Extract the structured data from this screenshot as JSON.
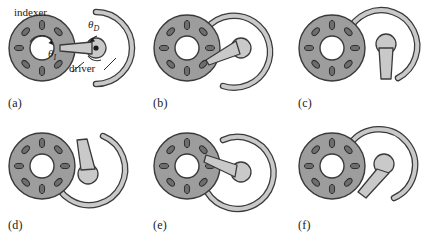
{
  "figure": {
    "type": "mechanism-diagram",
    "background_color": "#ffffff",
    "panel_count": 6,
    "grid": {
      "rows": 2,
      "cols": 3
    }
  },
  "colors": {
    "disc_fill": "#9d9d9d",
    "disc_stroke": "#3a3a3a",
    "hub_fill": "#ffffff",
    "slot_fill": "#6e6e6e",
    "slot_stroke": "#2f2f2f",
    "arm_fill": "#c9c9c9",
    "arm_stroke": "#3a3a3a",
    "arc_fill": "#c9c9c9",
    "arc_stroke": "#3a3a3a",
    "text": "#1a1a1a"
  },
  "annotations": {
    "indexer_label": "indexer",
    "driver_label": "driver",
    "theta_indexer": "θ",
    "theta_indexer_sub": "I",
    "theta_driver": "θ",
    "theta_driver_sub": "D"
  },
  "panels": [
    {
      "id": "a",
      "caption": "(a)",
      "arm_angle_deg": 0,
      "arm_description": "driver arm horizontal pointing left into indexer slot",
      "arc_gap_deg": 180,
      "engaged": true,
      "has_annotations": true
    },
    {
      "id": "b",
      "caption": "(b)",
      "arm_angle_deg": 205,
      "arm_description": "driver arm tilted down-left engaging slot",
      "arc_gap_deg": 165,
      "engaged": true,
      "has_annotations": false
    },
    {
      "id": "c",
      "caption": "(c)",
      "arm_angle_deg": 270,
      "arm_description": "driver arm pointing straight down, disengaged",
      "arc_gap_deg": 140,
      "engaged": false,
      "has_annotations": false
    },
    {
      "id": "d",
      "caption": "(d)",
      "arm_angle_deg": 90,
      "arm_description": "driver arm pointing up, arc sweeping across indexer",
      "arc_gap_deg": 60,
      "engaged": false,
      "has_annotations": false
    },
    {
      "id": "e",
      "caption": "(e)",
      "arm_angle_deg": 160,
      "arm_description": "driver arm tilted up-left engaging slot",
      "arc_gap_deg": 110,
      "engaged": true,
      "has_annotations": false
    },
    {
      "id": "f",
      "caption": "(f)",
      "arm_angle_deg": 120,
      "arm_description": "driver arm tilted up-left, disengaging",
      "arc_gap_deg": 45,
      "engaged": false,
      "has_annotations": false
    }
  ],
  "indexer": {
    "slot_count": 8,
    "outer_radius": 33,
    "hub_radius": 12,
    "slot_radius": 23,
    "description": "slotted disc with eight radial oval slots and central bore"
  },
  "driver": {
    "arc_outer_radius": 36,
    "arc_inner_radius": 31,
    "hub_radius": 10,
    "arm_length": 30,
    "description": "C-shaped locking arc with central hub and tapered crank arm"
  }
}
